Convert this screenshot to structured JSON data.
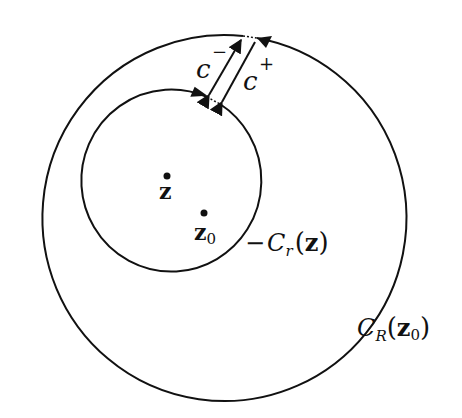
{
  "diagram": {
    "type": "contour-deformation",
    "background": "#ffffff",
    "stroke_color": "#111111",
    "outer_circle": {
      "center": [
        205,
        214
      ],
      "radius": 182,
      "label_main": "C",
      "label_sub": "R",
      "label_arg": "z",
      "label_arg_sub": "0"
    },
    "inner_circle": {
      "center": [
        167,
        178
      ],
      "radius": 90,
      "label_prefix": "−",
      "label_main": "C",
      "label_sub": "r",
      "label_arg": "z"
    },
    "points": [
      {
        "name": "z",
        "label": "z",
        "sub": "",
        "x": 165,
        "y": 175
      },
      {
        "name": "z0",
        "label": "z",
        "sub": "0",
        "x": 203,
        "y": 213
      }
    ],
    "connectors": [
      {
        "name": "c-minus",
        "label": "c",
        "sup": "−",
        "direction": "outer-to-inner"
      },
      {
        "name": "c-plus",
        "label": "c",
        "sup": "+",
        "direction": "inner-to-outer"
      }
    ]
  }
}
